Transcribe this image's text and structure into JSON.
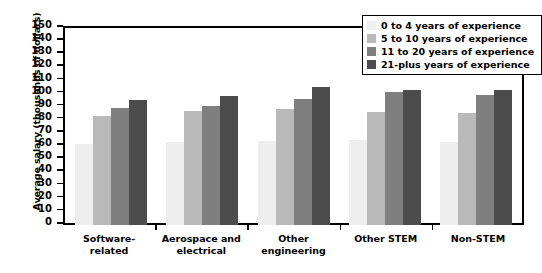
{
  "chart_data": {
    "type": "bar",
    "title": "",
    "xlabel": "",
    "ylabel": "Average salary (thousands of dollars)",
    "ylim": [
      0,
      150
    ],
    "yticks": [
      0,
      10,
      20,
      30,
      40,
      50,
      60,
      70,
      80,
      90,
      100,
      110,
      120,
      130,
      140,
      150
    ],
    "grid": false,
    "legend_position": "top-right",
    "categories": [
      "Software-related",
      "Aerospace and electrical",
      "Other engineering",
      "Other STEM",
      "Non-STEM"
    ],
    "series": [
      {
        "name": "0 to 4 years of experience",
        "color": "#eeeeee",
        "values": [
          62,
          63,
          64,
          65,
          63
        ]
      },
      {
        "name": "5 to 10 years of experience",
        "color": "#b9b9b9",
        "values": [
          83,
          87,
          88,
          86,
          85
        ]
      },
      {
        "name": "11 to 20 years of experience",
        "color": "#7f7f7f",
        "values": [
          89,
          91,
          96,
          101,
          99
        ]
      },
      {
        "name": "21-plus years of experience",
        "color": "#4c4c4c",
        "values": [
          95,
          98,
          105,
          103,
          103
        ]
      }
    ]
  },
  "legend": {
    "items": [
      {
        "label": "0 to 4 years of experience"
      },
      {
        "label": "5 to 10 years of experience"
      },
      {
        "label": "11 to 20 years of experience"
      },
      {
        "label": "21-plus years of experience"
      }
    ]
  }
}
